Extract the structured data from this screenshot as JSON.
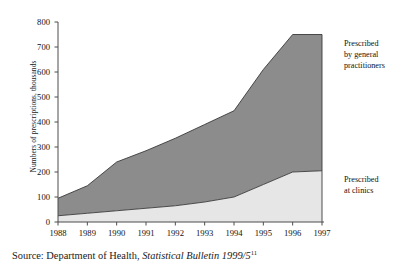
{
  "chart_data": {
    "type": "area",
    "stacked": true,
    "title": "",
    "xlabel": "",
    "ylabel": "Numbers of prescriptions, thousands",
    "categories": [
      "1988",
      "1989",
      "1990",
      "1991",
      "1992",
      "1993",
      "1994",
      "1995",
      "1996",
      "1997"
    ],
    "x": [
      1988,
      1989,
      1990,
      1991,
      1992,
      1993,
      1994,
      1995,
      1996,
      1997
    ],
    "ylim": [
      0,
      800
    ],
    "xlim": [
      1988,
      1997
    ],
    "y_ticks": [
      0,
      100,
      200,
      300,
      400,
      500,
      600,
      700,
      800
    ],
    "grid": false,
    "legend_position": "right",
    "series": [
      {
        "name": "Prescribed at clinics",
        "color": "#e6e6e6",
        "values": [
          25,
          35,
          45,
          55,
          65,
          80,
          100,
          150,
          200,
          205
        ]
      },
      {
        "name": "Prescribed by general practitioners",
        "color": "#8c8c8c",
        "values": [
          70,
          110,
          195,
          230,
          270,
          310,
          345,
          460,
          550,
          545
        ]
      }
    ],
    "totals": [
      95,
      145,
      240,
      285,
      335,
      390,
      445,
      610,
      750,
      750
    ]
  },
  "axes": {
    "y_title": "Numbers of prescriptions, thousands",
    "y_tick_labels": [
      "800",
      "700",
      "600",
      "500",
      "400",
      "300",
      "200",
      "100",
      "0"
    ],
    "x_tick_labels": [
      "1988",
      "1989",
      "1990",
      "1991",
      "1992",
      "1993",
      "1994",
      "1995",
      "1996",
      "1997"
    ]
  },
  "legend": {
    "gp": "Prescribed by general practitioners",
    "gp_lines": [
      "Prescribed",
      "by general",
      "practitioners"
    ],
    "clinics": "Prescribed at clinics",
    "clinics_lines": [
      "Prescribed",
      "at clinics"
    ]
  },
  "source": {
    "prefix": "Source: Department of Health,",
    "publication": "Statistical Bulletin 1999/5",
    "footnote_marker": "11"
  },
  "colors": {
    "band_upper": "#8c8c8c",
    "band_lower": "#e6e6e6",
    "axis": "#4d4d4d",
    "outline": "#3a3a3a",
    "text": "#1a1a1a",
    "background": "#ffffff"
  }
}
